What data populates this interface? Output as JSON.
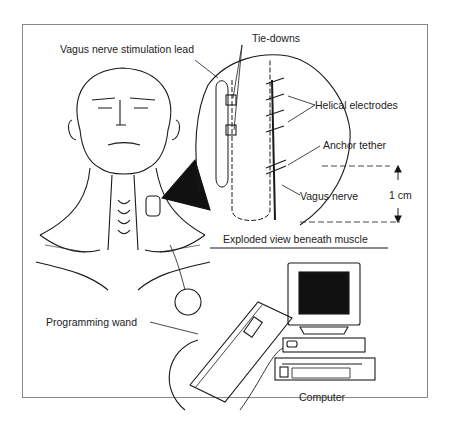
{
  "diagram": {
    "labels": {
      "lead": "Vagus nerve stimulation lead",
      "tie_downs": "Tie-downs",
      "helical_electrodes": "Helical electrodes",
      "anchor_tether": "Anchor tether",
      "vagus_nerve": "Vagus nerve",
      "scale": "1 cm",
      "exploded_view": "Exploded view beneath muscle",
      "programming_wand": "Programming wand",
      "computer": "Computer"
    },
    "components": [
      "head-and-neck",
      "pulse-generator",
      "lead",
      "exploded-inset",
      "programming-wand",
      "computer"
    ],
    "colors": {
      "line": "#1a1a1a",
      "background": "#ffffff",
      "frame": "#888888",
      "screen": "#111111"
    }
  }
}
